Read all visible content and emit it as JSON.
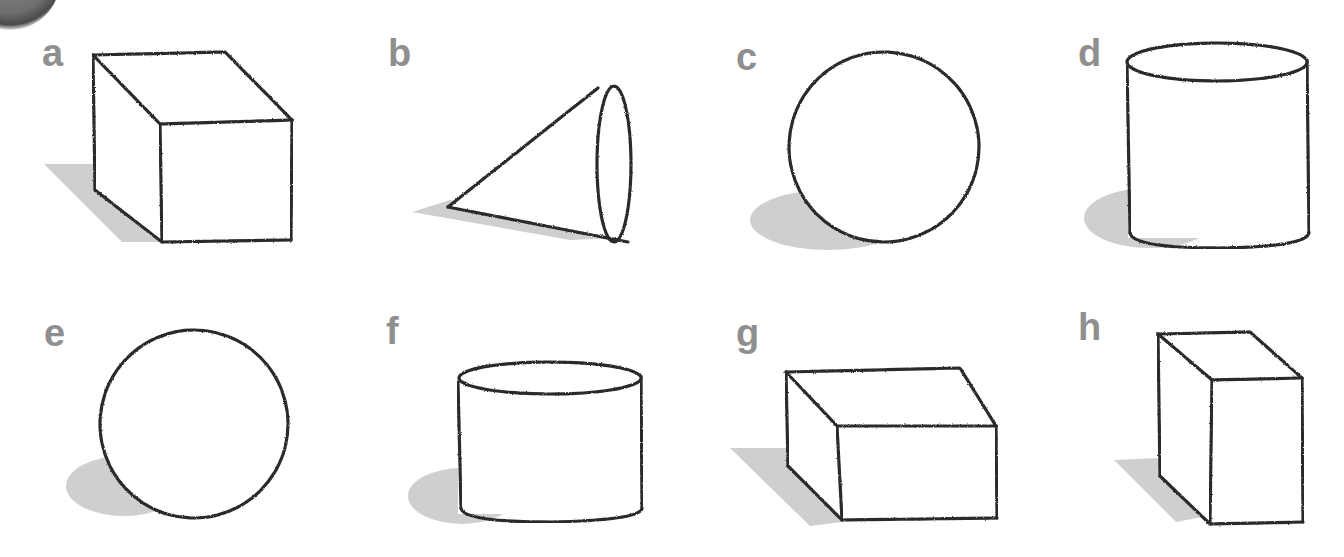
{
  "figure": {
    "colors": {
      "label": "#8f8f8f",
      "outline": "#2b2b2b",
      "shadow": "#cfcfcf",
      "background": "#ffffff"
    },
    "panels": [
      {
        "label": "a",
        "shape": "cube"
      },
      {
        "label": "b",
        "shape": "cone"
      },
      {
        "label": "c",
        "shape": "sphere"
      },
      {
        "label": "d",
        "shape": "cylinder"
      },
      {
        "label": "e",
        "shape": "sphere"
      },
      {
        "label": "f",
        "shape": "short-cylinder"
      },
      {
        "label": "g",
        "shape": "flat-box"
      },
      {
        "label": "h",
        "shape": "tall-box"
      }
    ]
  }
}
